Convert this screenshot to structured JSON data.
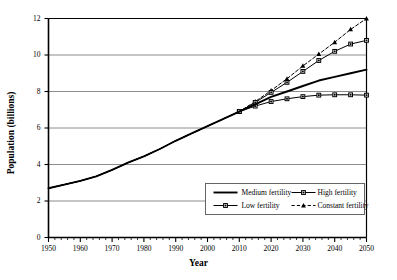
{
  "chart_data": {
    "type": "line",
    "title": "",
    "xlabel": "Year",
    "ylabel": "Population (billions)",
    "xlim": [
      1950,
      2050
    ],
    "ylim": [
      0,
      12
    ],
    "xticks": [
      1950,
      1960,
      1970,
      1980,
      1990,
      2000,
      2010,
      2020,
      2030,
      2040,
      2050
    ],
    "yticks": [
      0,
      2,
      4,
      6,
      8,
      10,
      12
    ],
    "minor_xtick_interval": 2,
    "grid": "horizontal",
    "legend_position": "lower-right-inside",
    "x": [
      1950,
      1955,
      1960,
      1965,
      1970,
      1975,
      1980,
      1985,
      1990,
      1995,
      2000,
      2005,
      2010,
      2015,
      2020,
      2025,
      2030,
      2035,
      2040,
      2045,
      2050
    ],
    "series": [
      {
        "name": "Medium fertility",
        "marker": "none",
        "dash": "solid",
        "values": [
          2.7,
          2.9,
          3.1,
          3.35,
          3.7,
          4.1,
          4.45,
          4.85,
          5.3,
          5.7,
          6.1,
          6.5,
          6.9,
          7.3,
          7.7,
          8.0,
          8.3,
          8.6,
          8.8,
          9.0,
          9.2
        ]
      },
      {
        "name": "High fertility",
        "marker": "square",
        "dash": "solid",
        "values": [
          2.7,
          2.9,
          3.1,
          3.35,
          3.7,
          4.1,
          4.45,
          4.85,
          5.3,
          5.7,
          6.1,
          6.5,
          6.9,
          7.4,
          7.95,
          8.5,
          9.1,
          9.7,
          10.2,
          10.6,
          10.8
        ]
      },
      {
        "name": "Low fertility",
        "marker": "square",
        "dash": "solid",
        "values": [
          2.7,
          2.9,
          3.1,
          3.35,
          3.7,
          4.1,
          4.45,
          4.85,
          5.3,
          5.7,
          6.1,
          6.5,
          6.9,
          7.2,
          7.45,
          7.6,
          7.72,
          7.8,
          7.82,
          7.82,
          7.8
        ]
      },
      {
        "name": "Constant fertility",
        "marker": "triangle",
        "dash": "dashed",
        "values": [
          2.7,
          2.9,
          3.1,
          3.35,
          3.7,
          4.1,
          4.45,
          4.85,
          5.3,
          5.7,
          6.1,
          6.5,
          6.9,
          7.45,
          8.05,
          8.7,
          9.4,
          10.05,
          10.7,
          11.4,
          12.0
        ]
      }
    ]
  },
  "legend": {
    "entries": [
      {
        "label": "Medium fertility"
      },
      {
        "label": "High fertility"
      },
      {
        "label": "Low fertility"
      },
      {
        "label": "Constant fertility"
      }
    ]
  },
  "colors": {
    "line": "#000000",
    "grid": "#808080",
    "axis": "#000000",
    "background": "#ffffff"
  }
}
